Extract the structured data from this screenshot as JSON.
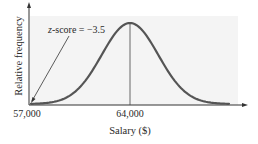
{
  "chart_data": {
    "type": "line",
    "title": "",
    "xlabel": "Salary ($)",
    "ylabel": "Relative frequency",
    "x_ticks": [
      {
        "value": 57000,
        "label": "57,000"
      },
      {
        "value": 64000,
        "label": "64,000"
      }
    ],
    "distribution": "normal",
    "mean": 64000,
    "std_dev": 2000,
    "xlim": [
      57000,
      71000
    ],
    "annotations": [
      {
        "text_prefix": "z",
        "text_suffix": "-score = −3.5",
        "points_to_x": 57000,
        "z_score": -3.5
      }
    ],
    "mean_line": {
      "x": 64000
    },
    "grid": false,
    "legend": null,
    "colors": {
      "curve": "#555555",
      "background_band": "#f4f4f4",
      "axis": "#333333",
      "mean_line": "#444444"
    }
  }
}
